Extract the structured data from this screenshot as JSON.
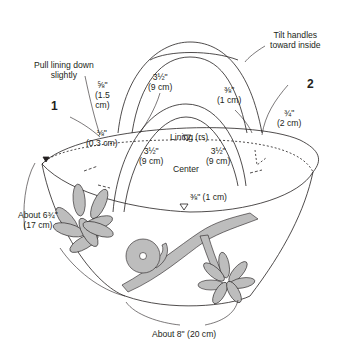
{
  "diagram": {
    "step_markers": [
      "1",
      "2"
    ],
    "annotations": {
      "pull_lining": [
        "Pull lining down",
        "slightly"
      ],
      "tilt_handles": [
        "Tilt handles",
        "toward inside"
      ],
      "left_handle_offset": [
        "⅝\"",
        "(1.5",
        "cm)"
      ],
      "back_handle_width": [
        "3½\"",
        "(9 cm)"
      ],
      "back_right_offset": [
        "⅜\"",
        "(1 cm)"
      ],
      "right_offset": [
        "¾\"",
        "(2 cm)"
      ],
      "lining_label": "Lining (rs)",
      "left_seam": [
        "⅛\"",
        "(0.3 cm)"
      ],
      "front_left_width": [
        "3½\"",
        "(9 cm)"
      ],
      "front_right_width": [
        "3½\"",
        "(9 cm)"
      ],
      "center_label": "Center",
      "front_offset": "⅜\" (1 cm)",
      "height": [
        "About 6¾\"",
        "(17 cm)"
      ],
      "bottom_width": "About 8\" (20 cm)"
    },
    "colors": {
      "line": "#231f20",
      "fill_motif": "#bdbdbd",
      "background": "#ffffff"
    }
  }
}
